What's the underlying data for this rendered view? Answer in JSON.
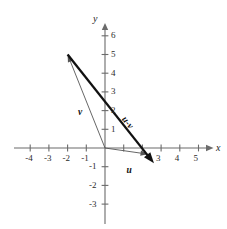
{
  "figure": {
    "title": "",
    "background_color": "#ffffff",
    "axis_color": "#6b6b6b",
    "vector_color": "#111111",
    "thin_vector_color": "#555555"
  },
  "axes": {
    "x_name": "x",
    "y_name": "y",
    "x_ticks": [
      {
        "value": -4,
        "label": "-4"
      },
      {
        "value": -3,
        "label": "-3"
      },
      {
        "value": -2,
        "label": "-2"
      },
      {
        "value": -1,
        "label": "-1"
      },
      {
        "value": 1,
        "label": ""
      },
      {
        "value": 2,
        "label": ""
      },
      {
        "value": 3,
        "label": "3"
      },
      {
        "value": 4,
        "label": "4"
      },
      {
        "value": 5,
        "label": "5"
      }
    ],
    "y_ticks": [
      {
        "value": 6,
        "label": "6"
      },
      {
        "value": 5,
        "label": "5"
      },
      {
        "value": 4,
        "label": "4"
      },
      {
        "value": 3,
        "label": "3"
      },
      {
        "value": 2,
        "label": "2"
      },
      {
        "value": 1,
        "label": "1"
      },
      {
        "value": -1,
        "label": "-1"
      },
      {
        "value": -2,
        "label": "-2"
      },
      {
        "value": -3,
        "label": "-3"
      }
    ]
  },
  "chart_data": {
    "type": "scatter",
    "title": "",
    "xlabel": "x",
    "ylabel": "y",
    "xlim": [
      -4.9,
      5.9
    ],
    "ylim": [
      -3.9,
      6.6
    ],
    "grid": false,
    "legend": "none",
    "vectors": [
      {
        "name": "v",
        "label": "v",
        "tail": [
          0,
          0
        ],
        "head": [
          -2,
          5
        ],
        "style": "thin",
        "label_pos": [
          -1.45,
          2.15
        ],
        "label_rotation": 0
      },
      {
        "name": "u",
        "label": "u",
        "tail": [
          0,
          0
        ],
        "head": [
          2.3,
          -0.33
        ],
        "style": "thin",
        "label_pos": [
          1.15,
          -0.95
        ],
        "label_rotation": 0
      },
      {
        "name": "u-v",
        "label": "u-v",
        "tail": [
          -2,
          5
        ],
        "head": [
          2.62,
          -0.82
        ],
        "style": "thick",
        "label_pos": [
          1.15,
          1.75
        ],
        "label_rotation": 51.5
      }
    ]
  }
}
